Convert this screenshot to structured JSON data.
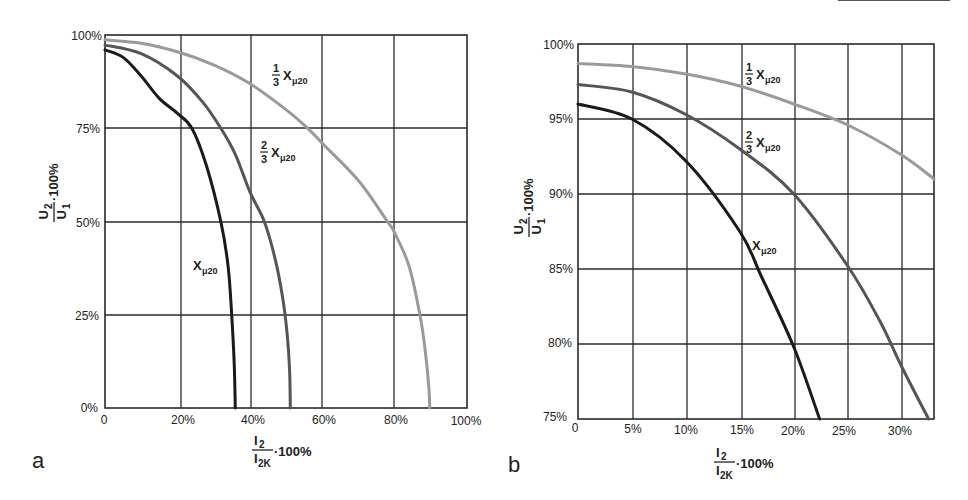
{
  "chart_data": [
    {
      "panel": "a",
      "type": "line",
      "title": "",
      "xlabel": "I2/I2K · 100%",
      "ylabel": "U2/U1 · 100%",
      "xlim": [
        0,
        100
      ],
      "ylim": [
        0,
        100
      ],
      "x_ticks": [
        "0",
        "20%",
        "40%",
        "60%",
        "80%",
        "100%"
      ],
      "y_ticks": [
        "0%",
        "25%",
        "50%",
        "75%",
        "100%"
      ],
      "grid": true,
      "series": [
        {
          "name": "1/3 Xμ20",
          "color": "#9a9a9a",
          "points": [
            [
              0,
              98.7
            ],
            [
              10,
              97.8
            ],
            [
              20,
              95.5
            ],
            [
              30,
              92
            ],
            [
              40,
              87
            ],
            [
              50,
              80
            ],
            [
              56,
              75
            ],
            [
              60,
              71
            ],
            [
              70,
              61
            ],
            [
              78,
              50
            ],
            [
              80,
              47
            ],
            [
              84,
              38
            ],
            [
              87,
              25
            ],
            [
              88.5,
              15
            ],
            [
              89.5,
              5
            ],
            [
              89.7,
              0
            ]
          ]
        },
        {
          "name": "2/3 Xμ20",
          "color": "#555555",
          "points": [
            [
              0,
              97.3
            ],
            [
              10,
              95
            ],
            [
              20,
              89
            ],
            [
              27,
              82
            ],
            [
              32,
              75
            ],
            [
              36,
              68
            ],
            [
              40,
              58
            ],
            [
              44,
              50
            ],
            [
              47,
              40
            ],
            [
              49,
              30
            ],
            [
              50.3,
              20
            ],
            [
              51,
              10
            ],
            [
              51.2,
              0
            ]
          ]
        },
        {
          "name": "Xμ20",
          "color": "#1a1a1a",
          "points": [
            [
              0,
              96
            ],
            [
              5,
              94
            ],
            [
              10,
              89
            ],
            [
              15,
              83
            ],
            [
              20,
              79
            ],
            [
              24,
              75
            ],
            [
              28,
              65
            ],
            [
              32,
              50
            ],
            [
              34,
              38
            ],
            [
              35,
              25
            ],
            [
              35.7,
              12
            ],
            [
              36,
              0
            ]
          ]
        }
      ],
      "annotations": [
        {
          "text": "1/3 Xμ20",
          "x": 42,
          "y": 85
        },
        {
          "text": "2/3 Xμ20",
          "x": 42,
          "y": 65
        },
        {
          "text": "Xμ20",
          "x": 26,
          "y": 42
        }
      ]
    },
    {
      "panel": "b",
      "type": "line",
      "title": "",
      "xlabel": "I2/I2K · 100%",
      "ylabel": "U2/U1 · 100%",
      "xlim": [
        0,
        33
      ],
      "ylim": [
        75,
        100
      ],
      "x_ticks": [
        "0",
        "5%",
        "10%",
        "15%",
        "20%",
        "25%",
        "30%"
      ],
      "y_ticks": [
        "75%",
        "80%",
        "85%",
        "90%",
        "95%",
        "100%"
      ],
      "grid": true,
      "series": [
        {
          "name": "1/3 Xμ20",
          "color": "#9a9a9a",
          "points": [
            [
              0,
              98.7
            ],
            [
              5,
              98.5
            ],
            [
              10,
              98
            ],
            [
              15,
              97.2
            ],
            [
              20,
              96
            ],
            [
              25,
              94.6
            ],
            [
              30,
              92.6
            ],
            [
              33,
              91
            ]
          ]
        },
        {
          "name": "2/3 Xμ20",
          "color": "#555555",
          "points": [
            [
              0,
              97.3
            ],
            [
              5,
              96.8
            ],
            [
              10,
              95.3
            ],
            [
              15,
              93
            ],
            [
              20,
              90
            ],
            [
              25,
              85.2
            ],
            [
              28,
              81.5
            ],
            [
              30,
              78.5
            ],
            [
              32.5,
              75
            ]
          ]
        },
        {
          "name": "Xμ20",
          "color": "#1a1a1a",
          "points": [
            [
              0,
              96
            ],
            [
              5,
              95
            ],
            [
              10,
              92.2
            ],
            [
              15,
              87.5
            ],
            [
              17,
              84.5
            ],
            [
              20,
              79.8
            ],
            [
              22.4,
              75
            ]
          ]
        }
      ],
      "annotations": [
        {
          "text": "1/3 Xμ20",
          "x": 15.5,
          "y": 97.8
        },
        {
          "text": "2/3 Xμ20",
          "x": 15.5,
          "y": 93.3
        },
        {
          "text": "Xμ20",
          "x": 16.5,
          "y": 87.8
        }
      ]
    }
  ],
  "panels": {
    "a": {
      "letter": "a",
      "y_ticks": [
        "100%",
        "75%",
        "50%",
        "25%",
        "0%"
      ],
      "x_ticks": [
        "0",
        "20%",
        "40%",
        "60%",
        "80%",
        "100%"
      ],
      "ylabel_num": "U",
      "ylabel_num_sub": "2",
      "ylabel_den": "U",
      "ylabel_den_sub": "1",
      "ylabel_tail": "·100%",
      "xlabel_num": "I",
      "xlabel_num_sub": "2",
      "xlabel_den": "I",
      "xlabel_den_sub": "2K",
      "xlabel_tail": "·100%"
    },
    "b": {
      "letter": "b",
      "y_ticks": [
        "100%",
        "95%",
        "90%",
        "85%",
        "80%",
        "75%"
      ],
      "x_ticks": [
        "0",
        "5%",
        "10%",
        "15%",
        "20%",
        "25%",
        "30%"
      ],
      "ylabel_num": "U",
      "ylabel_num_sub": "2",
      "ylabel_den": "U",
      "ylabel_den_sub": "1",
      "ylabel_tail": "·100%",
      "xlabel_num": "I",
      "xlabel_num_sub": "2",
      "xlabel_den": "I",
      "xlabel_den_sub": "2K",
      "xlabel_tail": "·100%"
    }
  },
  "labels": {
    "frac_one": "1",
    "frac_two": "2",
    "frac_three": "3",
    "x_main": "X",
    "x_sub": "μ20"
  }
}
